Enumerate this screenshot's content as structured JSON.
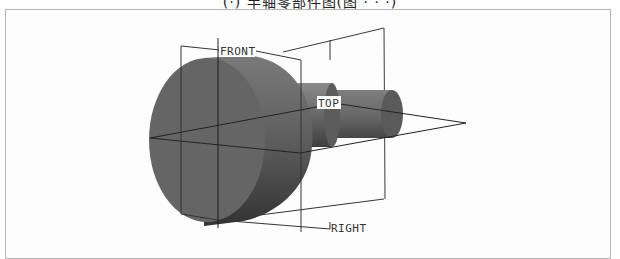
{
  "figure": {
    "caption_partial": "(·) 半轴零部件图(图 · · ·)",
    "view_type": "3D model view with datum planes",
    "datum_planes": [
      {
        "label": "FRONT"
      },
      {
        "label": "TOP"
      },
      {
        "label": "RIGHT"
      }
    ],
    "colors": {
      "background": "#ffffff",
      "frame_border": "#b5b5b5",
      "disc_face": "#636363",
      "disc_rim": "#4a4a4a",
      "shaft": "#6e6e6e",
      "shaft_dark": "#4c4c4c",
      "datum_line": "#2a2a2a"
    }
  }
}
